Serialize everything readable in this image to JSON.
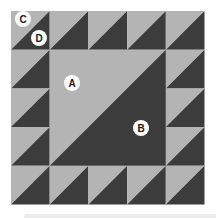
{
  "diagram": {
    "type": "quilt-block",
    "grid": {
      "rows": 5,
      "cols": 5
    },
    "colors": {
      "light": "#b4b4b4",
      "dark": "#3c3c3c",
      "label_bg": "#ffffff",
      "label_text": "#1a1a1a"
    },
    "pieces": {
      "center": "large half-square triangle spanning 3x3 center cells, light upper-left, dark lower-right",
      "border": "16 small half-square triangles, light upper-left, dark lower-right"
    },
    "labels": [
      {
        "id": "A",
        "text": "A",
        "x": 72,
        "y": 83
      },
      {
        "id": "B",
        "text": "B",
        "x": 141,
        "y": 128
      },
      {
        "id": "C",
        "text": "C",
        "x": 23,
        "y": 19
      },
      {
        "id": "D",
        "text": "D",
        "x": 39,
        "y": 38
      }
    ]
  }
}
